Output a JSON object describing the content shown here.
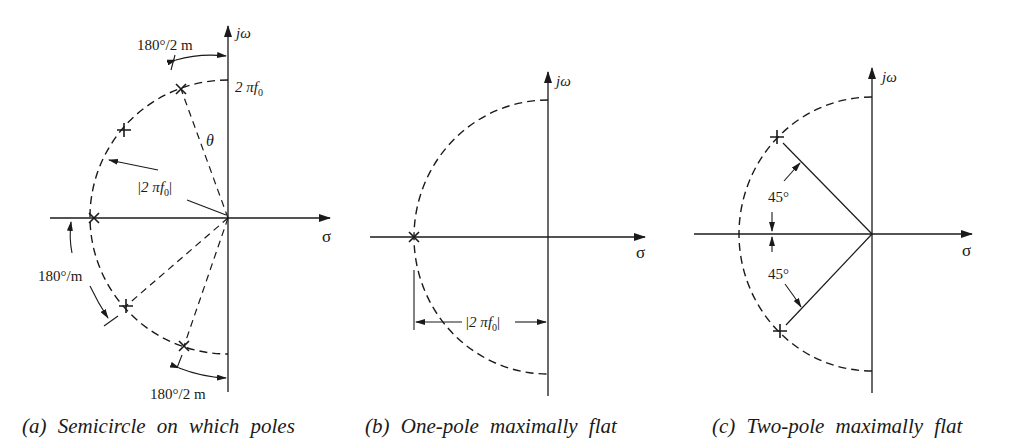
{
  "figure": {
    "panels": [
      {
        "id": "a",
        "caption": "(a) Semicircle on which poles",
        "axis_labels": {
          "imag": "jω",
          "real": "σ"
        },
        "labels": {
          "top_angle": "180°/2 m",
          "radius_freq": "2 πf",
          "radius_freq_sub": "0",
          "theta": "θ",
          "magnitude": "|2 πf",
          "magnitude_sub": "0",
          "magnitude_close": "|",
          "mid_angle": "180°/m",
          "bottom_angle": "180°/2 m"
        },
        "poles": 5
      },
      {
        "id": "b",
        "caption": "(b) One-pole maximally flat",
        "axis_labels": {
          "imag": "jω",
          "real": "σ"
        },
        "labels": {
          "magnitude": "|2 πf",
          "magnitude_sub": "0",
          "magnitude_close": "|"
        },
        "poles": 1
      },
      {
        "id": "c",
        "caption": "(c) Two-pole maximally flat",
        "axis_labels": {
          "imag": "jω",
          "real": "σ"
        },
        "labels": {
          "upper_angle": "45°",
          "lower_angle": "45°"
        },
        "poles": 2
      }
    ]
  }
}
